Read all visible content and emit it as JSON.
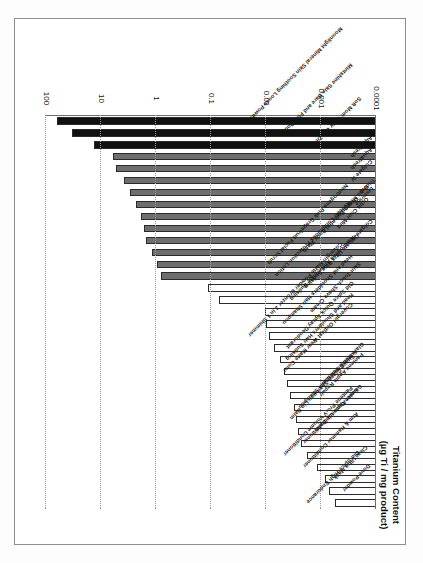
{
  "figure": {
    "border_color": "#8d8d8d",
    "background": "#ffffff"
  },
  "chart_data": {
    "type": "bar",
    "orientation": "horizontal",
    "title": "",
    "xlabel": "",
    "ylabel": "Titanium Content (µg Ti / mg product)",
    "axis_title_line1": "Titanium Content",
    "axis_title_line2": "(µg Ti / mg product)",
    "scale": "log",
    "ylim": [
      0.0001,
      100
    ],
    "grid": true,
    "grid_axis": "value",
    "legend": null,
    "tick_labels": [
      "100",
      "10",
      "1",
      "0.1",
      "0.01",
      "0.001",
      "0.0001"
    ],
    "tick_values": [
      100,
      10,
      1,
      0.1,
      0.01,
      0.001,
      0.0001
    ],
    "colors": {
      "high": "#111111",
      "medium": "#6e6e6e",
      "low": "#ffffff",
      "bar_outline": "#2b2b2b",
      "gridline": "#9a9a9a",
      "axis": "#6f6f6f"
    },
    "group_names": {
      "high": "black",
      "medium": "gray",
      "low": "white"
    },
    "categories": [
      "Moonlight Mineral Skin Soothing Loose Powder",
      "Mintshine Skin Bare and Fine Body",
      "Soft Mom Ivory Bar Zinc",
      "Aquafresh",
      "Aquafresh",
      "Colgate IV",
      "Trident",
      "Listerine",
      "Orbit Mint Strip",
      "Orbit Cool Mint",
      "Colgate III",
      "Ocean Potential Body Wash",
      "Neutrogena Pink Grapefruit Facial Scrub",
      "Aveeno Continuous Protection Lotion",
      "Colgate Ultra Blue Sudsing",
      "Neutrogena Antiwrinkle Sudsing",
      "Skin Touch Shave Cream",
      "Head and Shoulders Hair Shampoo",
      "Covergirl Matte Powder Bronzer 2 in 1 Shimmer",
      "Old Spice Quick Spray Deodorant",
      "Head and Shoulders Hair Sudsing",
      "Covergirl Outlast Wear Matte Color",
      "Glare Home Solution",
      "Pantene Apple Repair",
      "Suave Green Clean Shampoo",
      "Suave Green Shampoo Lip Balm",
      "Garnier Apple Lip Balm",
      "Suave Coconut Conditioner",
      "Pantene Pro-V Volume Conditioner",
      "Arm & Hammer Conditioner",
      "Clear Ultra Mask",
      "Dove Powder",
      "Old Spice High Endurance"
    ],
    "values": [
      62.0,
      33.0,
      13.5,
      6.0,
      5.4,
      3.8,
      3.0,
      2.3,
      1.9,
      1.65,
      1.5,
      1.2,
      0.95,
      0.82,
      0.115,
      0.072,
      0.0105,
      0.0098,
      0.0088,
      0.0072,
      0.0055,
      0.0047,
      0.0041,
      0.0036,
      0.0031,
      0.0028,
      0.0026,
      0.0023,
      0.0018,
      0.0012,
      0.00085,
      0.00072,
      0.00055
    ],
    "groups": [
      "high",
      "high",
      "high",
      "medium",
      "medium",
      "medium",
      "medium",
      "medium",
      "medium",
      "medium",
      "medium",
      "medium",
      "medium",
      "medium",
      "low",
      "low",
      "low",
      "low",
      "low",
      "low",
      "low",
      "low",
      "low",
      "low",
      "low",
      "low",
      "low",
      "low",
      "low",
      "low",
      "low",
      "low",
      "low"
    ]
  }
}
